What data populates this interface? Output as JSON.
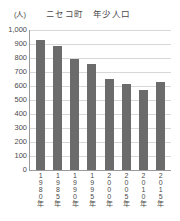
{
  "chart_data": {
    "type": "bar",
    "title": "ニセコ町　年少人口",
    "xlabel": "",
    "ylabel": "(人)",
    "ylim": [
      0,
      1000
    ],
    "grid": true,
    "legend": false,
    "categories": [
      "1980年",
      "1985年",
      "1990年",
      "1995年",
      "2000年",
      "2005年",
      "2010年",
      "2015年"
    ],
    "values": [
      928,
      886,
      790,
      760,
      650,
      613,
      572,
      632
    ],
    "ytick_labels": [
      "1,000",
      "900",
      "800",
      "700",
      "600",
      "500",
      "400",
      "300",
      "200",
      "100",
      "0"
    ],
    "ytick_values": [
      1000,
      900,
      800,
      700,
      600,
      500,
      400,
      300,
      200,
      100,
      0
    ],
    "bar_color": "#6b6b6b",
    "grid_color": "#d8d8d8",
    "axis_color": "#9a9a9a",
    "text_color": "#4a4a4a"
  }
}
